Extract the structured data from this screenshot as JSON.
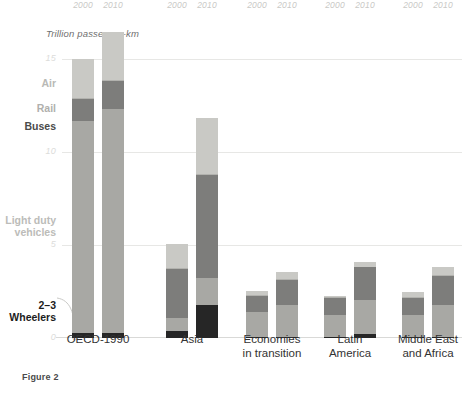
{
  "figure": {
    "caption": "Figure 2",
    "unit_label": "Trillion passenger-km"
  },
  "axis": {
    "yticks": [
      "15",
      "10",
      "5",
      "0"
    ],
    "ytick_values": [
      15,
      10,
      5,
      0
    ],
    "ylim": [
      0,
      17
    ],
    "grid": true
  },
  "series_labels": {
    "air": "Air",
    "rail": "Rail",
    "buses": "Buses",
    "light_duty_vehicles": "Light duty\nvehicles",
    "two_three_wheelers": "2–3\nWheelers"
  },
  "colors": {
    "air": "#c9c9c5",
    "rail": "#b2b2ae",
    "buses": "#7d7d7b",
    "light_duty_vehicles": "#a8a8a4",
    "two_three_wheelers": "#262626",
    "gridline": "#e7e7e5",
    "background": "#ffffff"
  },
  "groups": [
    {
      "name": "OECD-1990",
      "years": [
        "2000",
        "2010"
      ]
    },
    {
      "name": "Asia",
      "years": [
        "2000",
        "2010"
      ]
    },
    {
      "name": "Economies\nin transition",
      "years": [
        "2000",
        "2010"
      ]
    },
    {
      "name": "Latin\nAmerica",
      "years": [
        "2000",
        "2010"
      ]
    },
    {
      "name": "Middle East\nand Africa",
      "years": [
        "2000",
        "2010"
      ]
    }
  ],
  "chart_data": {
    "type": "bar",
    "subtype": "stacked",
    "title": "",
    "xlabel": "",
    "ylabel": "Trillion passenger-km",
    "ylim": [
      0,
      17
    ],
    "yticks": [
      0,
      5,
      10,
      15
    ],
    "grid": true,
    "legend_position": "left-inline",
    "categories": [
      "OECD-1990 2000",
      "OECD-1990 2010",
      "Asia 2000",
      "Asia 2010",
      "Economies in transition 2000",
      "Economies in transition 2010",
      "Latin America 2000",
      "Latin America 2010",
      "Middle East and Africa 2000",
      "Middle East and Africa 2010"
    ],
    "series": [
      {
        "name": "2-3 Wheelers",
        "values": [
          0.25,
          0.25,
          0.35,
          1.75,
          0.05,
          0.05,
          0.05,
          0.2,
          0.05,
          0.05
        ]
      },
      {
        "name": "Light duty vehicles",
        "values": [
          11.4,
          12.05,
          0.7,
          1.5,
          1.35,
          1.7,
          1.2,
          1.85,
          1.2,
          1.75
        ]
      },
      {
        "name": "Buses",
        "values": [
          1.2,
          1.55,
          2.65,
          5.5,
          0.85,
          1.35,
          0.9,
          1.75,
          0.9,
          1.55
        ]
      },
      {
        "name": "Rail",
        "values": [
          0.05,
          0.05,
          0.05,
          0.05,
          0.05,
          0.05,
          0.03,
          0.03,
          0.03,
          0.03
        ]
      },
      {
        "name": "Air",
        "values": [
          2.1,
          2.55,
          1.3,
          3.05,
          0.25,
          0.4,
          0.1,
          0.25,
          0.3,
          0.45
        ]
      }
    ],
    "totals": [
      15.0,
      16.45,
      5.05,
      11.85,
      2.55,
      3.55,
      2.28,
      4.08,
      2.48,
      3.83
    ],
    "group_labels": [
      "OECD-1990",
      "Asia",
      "Economies in transition",
      "Latin America",
      "Middle East and Africa"
    ],
    "year_labels": [
      "2000",
      "2010"
    ]
  }
}
